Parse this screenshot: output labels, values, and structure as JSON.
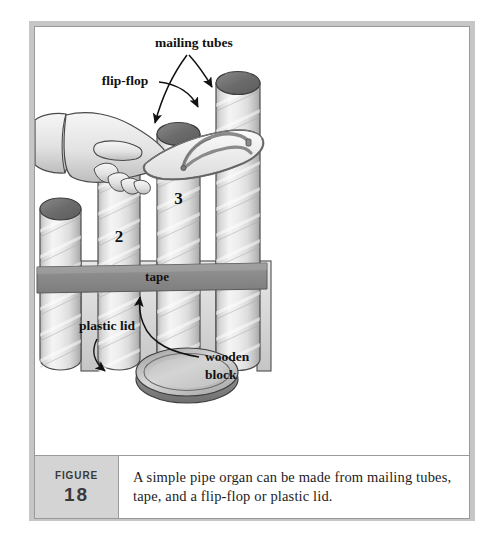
{
  "figure": {
    "label_word": "Figure",
    "number": "18",
    "caption": "A simple pipe organ can be made from mailing tubes, tape, and a flip-flop or plastic lid."
  },
  "illustration": {
    "title": "pipe organ made from mailing tubes",
    "labels": {
      "flip_flop": "flip-flop",
      "mailing_tubes": "mailing tubes",
      "tape": "tape",
      "wooden_block": "wooden block",
      "wooden_block_line1": "wooden",
      "wooden_block_line2": "block",
      "plastic_lid": "plastic lid"
    },
    "tubes": [
      {
        "number": "1",
        "height_rank": 1
      },
      {
        "number": "2",
        "height_rank": 2
      },
      {
        "number": "3",
        "height_rank": 3
      },
      {
        "number": "4",
        "height_rank": 4
      }
    ],
    "colors": {
      "frame_border": "#c6c6c6",
      "frame_rule": "#9a9a9a",
      "figure_box_bg": "#d4d4d4",
      "tube_body_light": "#f2f2f2",
      "tube_body_shade": "#c9c9c9",
      "tube_top_dark": "#6e6e6e",
      "tape_gray": "#8e8e8e",
      "ink": "#111111",
      "skin_light": "#efefef",
      "skin_shade": "#c2c2c2",
      "lid_gray": "#b5b5b5"
    }
  }
}
